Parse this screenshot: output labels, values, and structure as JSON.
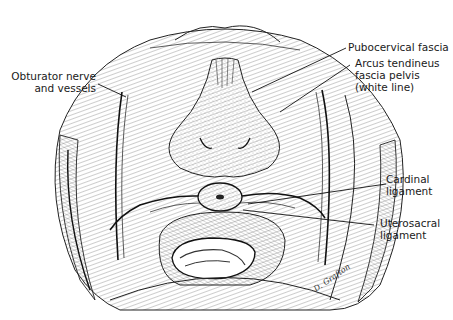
{
  "figure": {
    "labels": {
      "obturator": {
        "line1": "Obturator nerve",
        "line2": "and vessels"
      },
      "pubocervical": {
        "line1": "Pubocervical fascia"
      },
      "arcus": {
        "line1": "Arcus tendineus",
        "line2": "fascia pelvis",
        "line3": "(white line)"
      },
      "cardinal": {
        "line1": "Cardinal",
        "line2": "ligament"
      },
      "uterosacral": {
        "line1": "Uterosacral",
        "line2": "ligament"
      }
    },
    "signature": "D. Grafton",
    "colors": {
      "ink": "#1a1a1a",
      "background": "#ffffff",
      "shading": "#bdbdbd"
    }
  }
}
